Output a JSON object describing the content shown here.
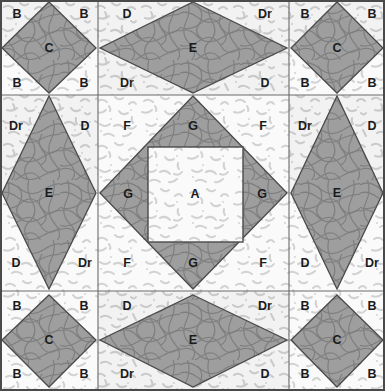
{
  "diagram": {
    "type": "quilt-block-layout",
    "width": 385,
    "height": 391,
    "grid": {
      "rows": 3,
      "cols": 3
    },
    "colors": {
      "patch_dark": "#9e9e9e",
      "patch_light": "#ededed",
      "patch_lightest": "#f6f6f6",
      "outline": "#4a4a4a",
      "grid_line": "#6b6b6b",
      "label_text": "#1a1a1a",
      "page_background": "#ffffff"
    },
    "textures": {
      "dark_patch": "contour-lines",
      "light_patch": "speckle-dashes"
    }
  },
  "cells": [
    {
      "name": "top-left",
      "shape": "square-on-point",
      "center_label": "C",
      "corner_labels": [
        "B",
        "B",
        "B",
        "B"
      ]
    },
    {
      "name": "top-center",
      "shape": "horizontal-diamond",
      "center_label": "E",
      "corner_labels": [
        "D",
        "Dr",
        "Dr",
        "D"
      ]
    },
    {
      "name": "top-right",
      "shape": "square-on-point",
      "center_label": "C",
      "corner_labels": [
        "B",
        "B",
        "B",
        "B"
      ]
    },
    {
      "name": "middle-left",
      "shape": "vertical-diamond",
      "center_label": "E",
      "corner_labels": [
        "Dr",
        "D",
        "D",
        "Dr"
      ]
    },
    {
      "name": "center",
      "shape": "square-in-diamond",
      "center_label": "A",
      "triangle_labels": [
        "G",
        "G",
        "G",
        "G"
      ],
      "corner_labels": [
        "F",
        "F",
        "F",
        "F"
      ]
    },
    {
      "name": "middle-right",
      "shape": "vertical-diamond",
      "center_label": "E",
      "corner_labels": [
        "Dr",
        "D",
        "D",
        "Dr"
      ]
    },
    {
      "name": "bottom-left",
      "shape": "square-on-point",
      "center_label": "C",
      "corner_labels": [
        "B",
        "B",
        "B",
        "B"
      ]
    },
    {
      "name": "bottom-center",
      "shape": "horizontal-diamond",
      "center_label": "E",
      "corner_labels": [
        "D",
        "Dr",
        "Dr",
        "D"
      ]
    },
    {
      "name": "bottom-right",
      "shape": "square-on-point",
      "center_label": "C",
      "corner_labels": [
        "B",
        "B",
        "B",
        "B"
      ]
    }
  ],
  "labels": {
    "r1": {
      "tl_B1": "B",
      "tl_B2": "B",
      "tl_C": "C",
      "tl_B3": "B",
      "tl_B4": "B",
      "tc_D1": "D",
      "tc_Dr1": "Dr",
      "tc_E": "E",
      "tc_Dr2": "Dr",
      "tc_D2": "D",
      "tr_B1": "B",
      "tr_B2": "B",
      "tr_C": "C",
      "tr_B3": "B",
      "tr_B4": "B"
    },
    "r2": {
      "ml_Dr1": "Dr",
      "ml_D1": "D",
      "ml_E": "E",
      "ml_D2": "D",
      "ml_Dr2": "Dr",
      "c_F1": "F",
      "c_G1": "G",
      "c_F2": "F",
      "c_G2": "G",
      "c_A": "A",
      "c_G3": "G",
      "c_F3": "F",
      "c_G4": "G",
      "c_F4": "F",
      "mr_Dr1": "Dr",
      "mr_D1": "D",
      "mr_E": "E",
      "mr_D2": "D",
      "mr_Dr2": "Dr"
    },
    "r3": {
      "bl_B1": "B",
      "bl_B2": "B",
      "bl_C": "C",
      "bl_B3": "B",
      "bl_B4": "B",
      "bc_D1": "D",
      "bc_Dr1": "Dr",
      "bc_E": "E",
      "bc_Dr2": "Dr",
      "bc_D2": "D",
      "br_B1": "B",
      "br_B2": "B",
      "br_C": "C",
      "br_B3": "B",
      "br_B4": "B"
    }
  }
}
